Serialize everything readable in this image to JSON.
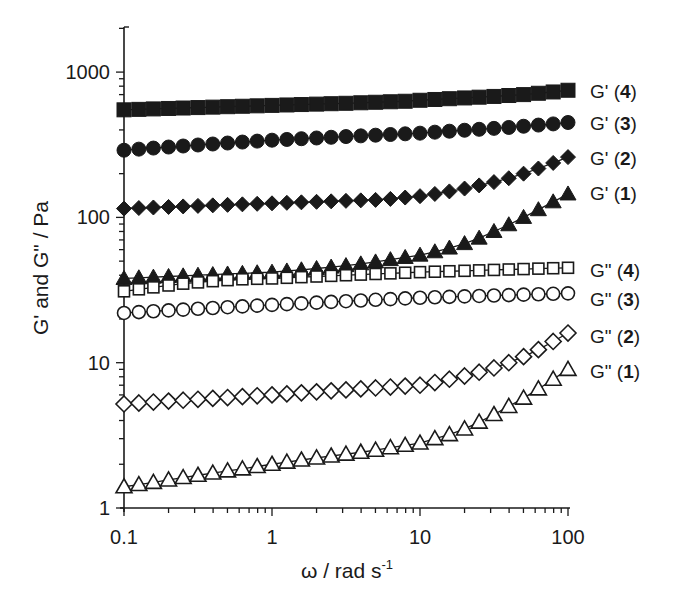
{
  "chart_data": {
    "type": "scatter",
    "title": "",
    "xlabel": "ω / rad s",
    "xlabel_superscript": "-1",
    "ylabel": "G' and G\" / Pa",
    "xscale": "log",
    "yscale": "log",
    "xlim": [
      0.1,
      100
    ],
    "ylim": [
      1,
      2000
    ],
    "grid": false,
    "legend_position": "right, inline labels at series ends",
    "x_ticks": [
      "0.1",
      "1",
      "10",
      "100"
    ],
    "y_ticks": [
      "1",
      "10",
      "100",
      "1000"
    ],
    "x": [
      0.1,
      0.126,
      0.158,
      0.2,
      0.251,
      0.316,
      0.398,
      0.501,
      0.631,
      0.794,
      1,
      1.26,
      1.58,
      2,
      2.51,
      3.16,
      3.98,
      5.01,
      6.31,
      7.94,
      10,
      12.6,
      15.8,
      20,
      25.1,
      31.6,
      39.8,
      50.1,
      63.1,
      79.4,
      100
    ],
    "series": [
      {
        "name": "G' (4)",
        "label": "G'",
        "sample": "4",
        "marker": "square",
        "filled": true,
        "values": [
          550,
          554,
          558,
          562,
          566,
          570,
          574,
          578,
          582,
          586,
          590,
          594,
          598,
          602,
          606,
          610,
          615,
          620,
          625,
          630,
          640,
          648,
          656,
          664,
          672,
          680,
          690,
          700,
          715,
          730,
          750
        ]
      },
      {
        "name": "G' (3)",
        "label": "G'",
        "sample": "3",
        "marker": "circle",
        "filled": true,
        "values": [
          290,
          295,
          300,
          305,
          310,
          315,
          320,
          325,
          330,
          335,
          340,
          344,
          348,
          352,
          356,
          360,
          364,
          368,
          372,
          376,
          380,
          386,
          392,
          398,
          404,
          410,
          416,
          424,
          432,
          440,
          450
        ]
      },
      {
        "name": "G' (2)",
        "label": "G'",
        "sample": "2",
        "marker": "diamond",
        "filled": true,
        "values": [
          115,
          116,
          117,
          118,
          119,
          120,
          121,
          122,
          123,
          124,
          125,
          126,
          127,
          128,
          129,
          130,
          131,
          132,
          134,
          137,
          140,
          145,
          151,
          158,
          166,
          175,
          186,
          200,
          217,
          237,
          260
        ]
      },
      {
        "name": "G' (1)",
        "label": "G'",
        "sample": "1",
        "marker": "triangle",
        "filled": true,
        "values": [
          38,
          38.4,
          38.8,
          39.2,
          39.6,
          40,
          40.4,
          40.8,
          41.2,
          41.6,
          42,
          42.8,
          43.6,
          44.5,
          45.5,
          46.6,
          47.9,
          49.4,
          51.2,
          53,
          55,
          58,
          61.5,
          66,
          72,
          80,
          89,
          100,
          113,
          128,
          145
        ]
      },
      {
        "name": "G\" (4)",
        "label": "G\"",
        "sample": "4",
        "marker": "square",
        "filled": false,
        "values": [
          31,
          32,
          33,
          34,
          35,
          35.7,
          36.4,
          37,
          37.5,
          37.8,
          38,
          38.4,
          38.8,
          39.2,
          39.6,
          40,
          40.4,
          40.8,
          41.2,
          41.6,
          42,
          42.3,
          42.6,
          42.9,
          43.2,
          43.5,
          43.8,
          44.1,
          44.4,
          44.7,
          45
        ]
      },
      {
        "name": "G\" (3)",
        "label": "G\"",
        "sample": "3",
        "marker": "circle",
        "filled": false,
        "values": [
          22,
          22.3,
          22.6,
          22.9,
          23.2,
          23.5,
          23.8,
          24.1,
          24.4,
          24.7,
          25,
          25.3,
          25.6,
          25.9,
          26.2,
          26.5,
          26.8,
          27.1,
          27.4,
          27.7,
          28,
          28.2,
          28.4,
          28.6,
          28.8,
          29,
          29.2,
          29.4,
          29.6,
          29.8,
          30
        ]
      },
      {
        "name": "G\" (2)",
        "label": "G\"",
        "sample": "2",
        "marker": "diamond",
        "filled": false,
        "values": [
          5.2,
          5.28,
          5.36,
          5.44,
          5.52,
          5.6,
          5.68,
          5.76,
          5.84,
          5.92,
          6.0,
          6.1,
          6.2,
          6.3,
          6.4,
          6.5,
          6.6,
          6.7,
          6.8,
          6.9,
          7.0,
          7.3,
          7.7,
          8.1,
          8.6,
          9.2,
          10.0,
          11.0,
          12.3,
          14.0,
          16.0
        ]
      },
      {
        "name": "G\" (1)",
        "label": "G\"",
        "sample": "1",
        "marker": "triangle",
        "filled": false,
        "values": [
          1.4,
          1.45,
          1.5,
          1.56,
          1.62,
          1.68,
          1.74,
          1.8,
          1.86,
          1.93,
          2.0,
          2.07,
          2.14,
          2.21,
          2.28,
          2.35,
          2.42,
          2.5,
          2.6,
          2.7,
          2.8,
          3.0,
          3.2,
          3.5,
          3.9,
          4.4,
          5.0,
          5.7,
          6.6,
          7.7,
          9.0
        ]
      }
    ]
  },
  "colors": {
    "ink": "#1a1a1a",
    "background": "#ffffff"
  }
}
